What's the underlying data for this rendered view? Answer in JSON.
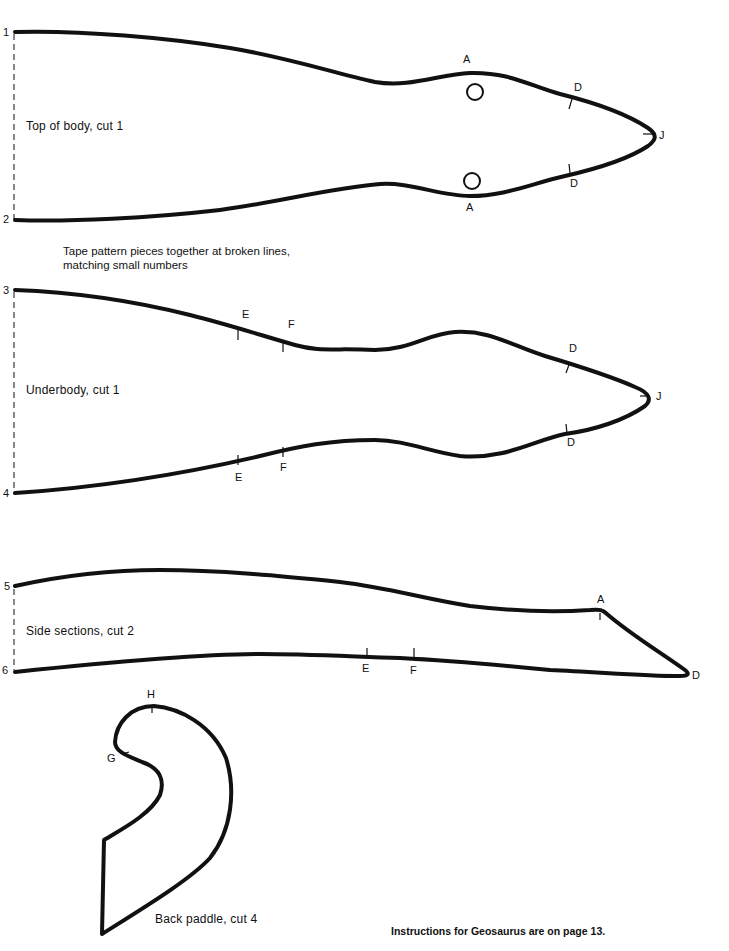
{
  "pieces": {
    "top_body": {
      "label": "Top of body, cut 1",
      "join_numbers": [
        "1",
        "2"
      ],
      "marks": [
        "A",
        "A",
        "D",
        "D",
        "J"
      ]
    },
    "underbody": {
      "label": "Underbody, cut 1",
      "join_numbers": [
        "3",
        "4"
      ],
      "marks": [
        "E",
        "F",
        "E",
        "F",
        "D",
        "D",
        "J"
      ]
    },
    "side_sections": {
      "label": "Side sections, cut 2",
      "join_numbers": [
        "5",
        "6"
      ],
      "marks": [
        "A",
        "E",
        "F",
        "D"
      ]
    },
    "back_paddle": {
      "label": "Back paddle, cut 4",
      "marks": [
        "H",
        "G"
      ]
    }
  },
  "note": {
    "line1": "Tape pattern pieces together at broken lines,",
    "line2": "matching small numbers"
  },
  "footer": "Instructions for Geosaurus are on page 13.",
  "colors": {
    "ink": "#111111",
    "paper": "#ffffff"
  }
}
